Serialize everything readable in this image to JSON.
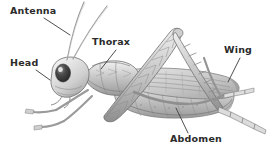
{
  "figure": {
    "style": "pencil-shaded scientific illustration",
    "background_color": "#ffffff",
    "label_color": "#2b2b2b",
    "leader_line_color": "#3a3a3a",
    "ink_color": "#7a7a7a"
  },
  "labels": [
    {
      "id": "antenna",
      "text": "Antenna"
    },
    {
      "id": "head",
      "text": "Head"
    },
    {
      "id": "thorax",
      "text": "Thorax"
    },
    {
      "id": "wing",
      "text": "Wing"
    },
    {
      "id": "abdomen",
      "text": "Abdomen"
    }
  ]
}
